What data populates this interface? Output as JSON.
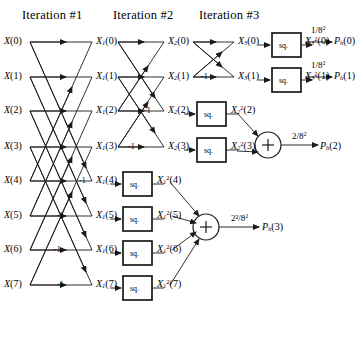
{
  "figure": {
    "headers": [
      {
        "id": "iteration-1",
        "label": "Iteration #1",
        "x": 22,
        "y": 8
      },
      {
        "id": "iteration-2",
        "label": "Iteration #2",
        "x": 113,
        "y": 8
      },
      {
        "id": "iteration-3",
        "label": "Iteration #3",
        "x": 199,
        "y": 8
      }
    ],
    "stage_x": {
      "stage0": 30,
      "stage1": 118,
      "stage2": 193,
      "stage3": 262
    },
    "row_y": [
      42,
      77,
      111,
      147,
      181,
      216,
      250,
      285
    ]
  },
  "inputs": [
    {
      "name": "X(0)",
      "base": "X",
      "arg": "(0)",
      "x": 4,
      "y": 36
    },
    {
      "name": "X(1)",
      "base": "X",
      "arg": "(1)",
      "x": 4,
      "y": 71
    },
    {
      "name": "X(2)",
      "base": "X",
      "arg": "(2)",
      "x": 4,
      "y": 105
    },
    {
      "name": "X(3)",
      "base": "X",
      "arg": "(3)",
      "x": 4,
      "y": 141
    },
    {
      "name": "X(4)",
      "base": "X",
      "arg": "(4)",
      "x": 4,
      "y": 175
    },
    {
      "name": "X(5)",
      "base": "X",
      "arg": "(5)",
      "x": 4,
      "y": 210
    },
    {
      "name": "X(6)",
      "base": "X",
      "arg": "(6)",
      "x": 4,
      "y": 244
    },
    {
      "name": "X(7)",
      "base": "X",
      "arg": "(7)",
      "x": 4,
      "y": 279
    }
  ],
  "stage1_nodes": [
    {
      "name": "X1(0)",
      "base": "X",
      "sub": "1",
      "arg": "(0)",
      "x": 96,
      "y": 36
    },
    {
      "name": "X1(1)",
      "base": "X",
      "sub": "1",
      "arg": "(1)",
      "x": 96,
      "y": 71
    },
    {
      "name": "X1(2)",
      "base": "X",
      "sub": "1",
      "arg": "(2)",
      "x": 96,
      "y": 105
    },
    {
      "name": "X1(3)",
      "base": "X",
      "sub": "1",
      "arg": "(3)",
      "x": 96,
      "y": 141
    },
    {
      "name": "X1(4)",
      "base": "X",
      "sub": "1",
      "arg": "(4)",
      "x": 96,
      "y": 175
    },
    {
      "name": "X1(5)",
      "base": "X",
      "sub": "1",
      "arg": "(5)",
      "x": 96,
      "y": 210
    },
    {
      "name": "X1(6)",
      "base": "X",
      "sub": "1",
      "arg": "(6)",
      "x": 96,
      "y": 244
    },
    {
      "name": "X1(7)",
      "base": "X",
      "sub": "1",
      "arg": "(7)",
      "x": 96,
      "y": 279
    }
  ],
  "stage2_nodes": [
    {
      "name": "X2(0)",
      "base": "X",
      "sub": "2",
      "arg": "(0)",
      "x": 168,
      "y": 36
    },
    {
      "name": "X2(1)",
      "base": "X",
      "sub": "2",
      "arg": "(1)",
      "x": 168,
      "y": 71
    },
    {
      "name": "X2(2)",
      "base": "X",
      "sub": "2",
      "arg": "(2)",
      "x": 168,
      "y": 105
    },
    {
      "name": "X2(3)",
      "base": "X",
      "sub": "2",
      "arg": "(3)",
      "x": 168,
      "y": 141
    }
  ],
  "stage3_nodes": [
    {
      "name": "X3(0)",
      "base": "X",
      "sub": "3",
      "arg": "(0)",
      "x": 238,
      "y": 36
    },
    {
      "name": "X3(1)",
      "base": "X",
      "sub": "3",
      "arg": "(1)",
      "x": 238,
      "y": 71
    }
  ],
  "squarers": [
    {
      "id": "sq-s3-0",
      "label": "sq.",
      "x": 272,
      "y": 33,
      "w": 29,
      "h": 24,
      "stage": 3
    },
    {
      "id": "sq-s3-1",
      "label": "sq.",
      "x": 272,
      "y": 68,
      "w": 29,
      "h": 24,
      "stage": 3
    },
    {
      "id": "sq-s2-2",
      "label": "sq.",
      "x": 197,
      "y": 102,
      "w": 29,
      "h": 24,
      "stage": 2
    },
    {
      "id": "sq-s2-3",
      "label": "sq.",
      "x": 197,
      "y": 138,
      "w": 29,
      "h": 24,
      "stage": 2
    },
    {
      "id": "sq-s1-4",
      "label": "sq.",
      "x": 123,
      "y": 172,
      "w": 29,
      "h": 24,
      "stage": 1
    },
    {
      "id": "sq-s1-5",
      "label": "sq.",
      "x": 123,
      "y": 207,
      "w": 29,
      "h": 24,
      "stage": 1
    },
    {
      "id": "sq-s1-6",
      "label": "sq.",
      "x": 123,
      "y": 241,
      "w": 29,
      "h": 24,
      "stage": 1
    },
    {
      "id": "sq-s1-7",
      "label": "sq.",
      "x": 123,
      "y": 276,
      "w": 29,
      "h": 24,
      "stage": 1
    }
  ],
  "squared_outputs": [
    {
      "name": "X3^2(0)",
      "base": "X",
      "sub": "3",
      "sup": "2",
      "arg": "(0)",
      "x": 305,
      "y": 36
    },
    {
      "name": "X3^2(1)",
      "base": "X",
      "sub": "3",
      "sup": "2",
      "arg": "(1)",
      "x": 305,
      "y": 71
    },
    {
      "name": "X2^2(2)",
      "base": "X",
      "sub": "2",
      "sup": "2",
      "arg": "(2)",
      "x": 231,
      "y": 105
    },
    {
      "name": "X2^2(3)",
      "base": "X",
      "sub": "2",
      "sup": "2",
      "arg": "(3)",
      "x": 231,
      "y": 141
    },
    {
      "name": "X1^2(4)",
      "base": "X",
      "sub": "1",
      "sup": "2",
      "arg": "(4)",
      "x": 157,
      "y": 175
    },
    {
      "name": "X1^2(5)",
      "base": "X",
      "sub": "1",
      "sup": "2",
      "arg": "(5)",
      "x": 157,
      "y": 210
    },
    {
      "name": "X1^2(6)",
      "base": "X",
      "sub": "1",
      "sup": "2",
      "arg": "(6)",
      "x": 157,
      "y": 244
    },
    {
      "name": "X1^2(7)",
      "base": "X",
      "sub": "1",
      "sup": "2",
      "arg": "(7)",
      "x": 157,
      "y": 279
    }
  ],
  "summers": [
    {
      "id": "summer-p2",
      "symbol": "+",
      "cx": 268,
      "cy": 145,
      "r": 13,
      "inputs": [
        "X2^2(2)",
        "X2^2(3)"
      ]
    },
    {
      "id": "summer-p3",
      "symbol": "+",
      "cx": 206,
      "cy": 227,
      "r": 13,
      "inputs": [
        "X1^2(4)",
        "X1^2(5)",
        "X1^2(6)",
        "X1^2(7)"
      ]
    }
  ],
  "gains": [
    {
      "id": "gain-p0",
      "label": "1/8",
      "exp": "2",
      "x": 311,
      "y": 25
    },
    {
      "id": "gain-p1",
      "label": "1/8",
      "exp": "2",
      "x": 311,
      "y": 60
    },
    {
      "id": "gain-p2",
      "label": "2/8",
      "exp": "2",
      "x": 292,
      "y": 131
    },
    {
      "id": "gain-p3",
      "label": "2²/8",
      "exp": "2",
      "x": 231,
      "y": 214
    }
  ],
  "outputs": [
    {
      "name": "Ph(0)",
      "base": "P",
      "sub": "h",
      "arg": "(0)",
      "x": 334,
      "y": 36
    },
    {
      "name": "Ph(1)",
      "base": "P",
      "sub": "h",
      "arg": "(1)",
      "x": 334,
      "y": 71
    },
    {
      "name": "Ph(2)",
      "base": "P",
      "sub": "h",
      "arg": "(2)",
      "x": 320,
      "y": 141
    },
    {
      "name": "Ph(3)",
      "base": "P",
      "sub": "h",
      "arg": "(3)",
      "x": 262,
      "y": 224
    }
  ],
  "negative_weights": [
    {
      "id": "neg-s1-4",
      "label": "-1",
      "x": 79,
      "y": 176
    },
    {
      "id": "neg-s1-5",
      "label": "-1",
      "x": 57,
      "y": 211
    },
    {
      "id": "neg-s1-6",
      "label": "-1",
      "x": 54,
      "y": 245
    },
    {
      "id": "neg-s1-7",
      "label": "-1",
      "x": 57,
      "y": 280
    },
    {
      "id": "neg-s2-2",
      "label": "-1",
      "x": 144,
      "y": 106
    },
    {
      "id": "neg-s2-3",
      "label": "-1",
      "x": 128,
      "y": 142
    },
    {
      "id": "neg-s3-1",
      "label": "-1",
      "x": 201,
      "y": 72
    }
  ],
  "colors": {
    "line": "#1a1a1a",
    "background": "#ffffff",
    "box_border": "#000000"
  }
}
